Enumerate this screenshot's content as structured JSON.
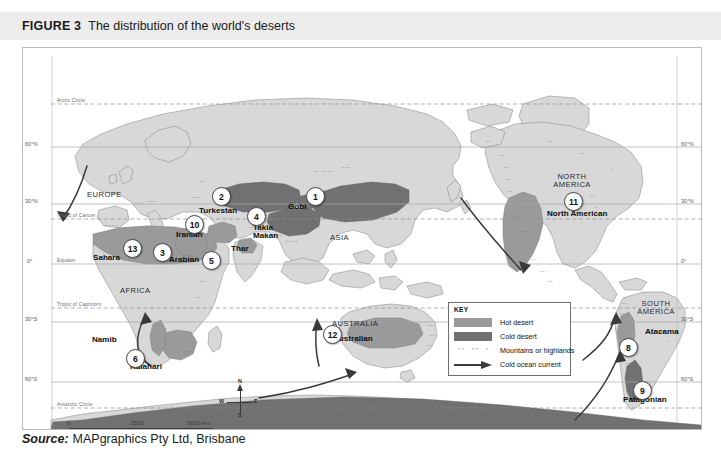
{
  "figure": {
    "label": "FIGURE 3",
    "title": "The distribution of the world's deserts"
  },
  "source": {
    "word": "Source:",
    "text": "MAPgraphics Pty Ltd, Brisbane"
  },
  "key": {
    "title": "KEY",
    "items": [
      {
        "symbol": "hot-desert-swatch",
        "label": "Hot desert",
        "color": "#9a9a9d"
      },
      {
        "symbol": "cold-desert-swatch",
        "label": "Cold desert",
        "color": "#717174"
      },
      {
        "symbol": "mountains-symbol",
        "label": "Mountains or highlands",
        "color": "#6a6a6d"
      },
      {
        "symbol": "cold-current-arrow",
        "label": "Cold ocean current",
        "color": "#3a3a3c"
      }
    ]
  },
  "scale": {
    "ticks": [
      "0",
      "2500",
      "5000 km"
    ]
  },
  "compass": {
    "north": "N",
    "south": "S",
    "east": "E",
    "west": "W"
  },
  "latitude_labels_left": [
    "60°N",
    "30°N",
    "0°",
    "30°S",
    "60°S"
  ],
  "latitude_labels_right": [
    "60°N",
    "30°N",
    "0°",
    "30°S",
    "60°S"
  ],
  "named_lines": [
    "Arctic Circle",
    "Tropic of Cancer",
    "Equator",
    "Tropic of Capricorn",
    "Antarctic Circle"
  ],
  "continents": [
    {
      "name": "EUROPE"
    },
    {
      "name": "ASIA"
    },
    {
      "name": "AFRICA"
    },
    {
      "name": "AUSTRALIA"
    },
    {
      "name": "NORTH\nAMERICA"
    },
    {
      "name": "SOUTH\nAMERICA"
    },
    {
      "name": "ANTARCTICA"
    }
  ],
  "deserts": [
    {
      "number": "1",
      "name": "Gobi",
      "type": "cold"
    },
    {
      "number": "2",
      "name": "Turkestan",
      "type": "cold"
    },
    {
      "number": "3",
      "name": "Arabian",
      "type": "hot"
    },
    {
      "number": "4",
      "name": "Takla Makan",
      "type": "cold"
    },
    {
      "number": "5",
      "name": "Thar",
      "type": "hot"
    },
    {
      "number": "6",
      "name": "Kalahari",
      "type": "hot"
    },
    {
      "number": "7",
      "name": "",
      "type": "cold"
    },
    {
      "number": "8",
      "name": "Atacama",
      "type": "hot"
    },
    {
      "number": "9",
      "name": "Patagonian",
      "type": "cold"
    },
    {
      "number": "10",
      "name": "Iranian",
      "type": "hot"
    },
    {
      "number": "11",
      "name": "North American",
      "type": "hot"
    },
    {
      "number": "12",
      "name": "Australian",
      "type": "hot"
    },
    {
      "number": "13",
      "name": "Sahara",
      "type": "hot"
    }
  ],
  "extra_labels": [
    "Namib"
  ],
  "colors": {
    "hot_desert": "#9a9a9d",
    "cold_desert": "#717174",
    "land": "#d8d8d9",
    "ocean": "#ffffff",
    "header_bar": "#ececed",
    "frame_border": "#b9b9bb",
    "graticule": "#9a9a9d"
  }
}
